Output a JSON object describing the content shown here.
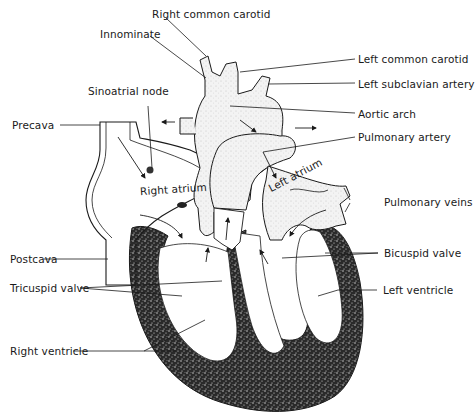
{
  "diagram": {
    "labels": {
      "right_common_carotid": "Right common carotid",
      "innominate": "Innominate",
      "left_common_carotid": "Left common carotid",
      "left_subclavian_artery": "Left subclavian artery",
      "sinoatrial_node": "Sinoatrial node",
      "aortic_arch": "Aortic arch",
      "precava": "Precava",
      "pulmonary_artery": "Pulmonary artery",
      "right_atrium": "Right atrium",
      "left_atrium": "Left atrium",
      "pulmonary_veins": "Pulmonary veins",
      "postcava": "Postcava",
      "bicuspid_valve": "Bicuspid valve",
      "tricuspid_valve": "Tricuspid valve",
      "left_ventricle": "Left ventricle",
      "right_ventricle": "Right ventricle"
    },
    "colors": {
      "ink": "#1a1a1a",
      "muscle": "#2b2b2b",
      "vessel_fill": "#eeeeee",
      "background": "#ffffff"
    }
  }
}
